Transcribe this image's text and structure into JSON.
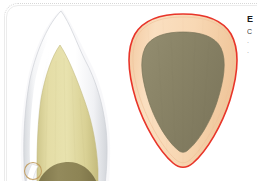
{
  "figure": {
    "background_color": "#ffffff",
    "frame_color": "#ececec",
    "panels": [
      {
        "id": "sagittal",
        "name": "tooth-sagittal-section",
        "description": "Longitudinal (labio-lingual) section of an anterior tooth crown",
        "layers": [
          {
            "name": "enamel",
            "color": "#ffffff",
            "edge_color": "#c9ccd1"
          },
          {
            "name": "enamel-shadow",
            "color": "#e2e5ea"
          },
          {
            "name": "dentin",
            "color": "#ddd69a",
            "edge_color": "#bfb77e"
          },
          {
            "name": "dentin-cut-surface",
            "color": "#8e8557"
          },
          {
            "name": "cervical-marker",
            "color": "#c09a5c"
          }
        ]
      },
      {
        "id": "axial",
        "name": "tooth-axial-section",
        "description": "Transverse (cross) section of the same tooth at the cervical level",
        "layers": [
          {
            "name": "outline",
            "color": "#e8352a"
          },
          {
            "name": "enamel-ring",
            "color": "#f7d6b0",
            "edge_color": "#edbc8c"
          },
          {
            "name": "dentin-core",
            "color": "#8a8467",
            "edge_color": "#7b755c"
          }
        ]
      }
    ]
  },
  "caption": {
    "title": "E",
    "lines": [
      "C",
      "·",
      "·"
    ]
  },
  "colors": {
    "enamel": "#ffffff",
    "enamel_shade": "#e2e5ea",
    "dentin": "#ddd69a",
    "dentin_dark": "#8e8557",
    "peach_ring": "#f7d6b0",
    "red_outline": "#e8352a",
    "olive_core": "#8a8467",
    "marker": "#c09a5c"
  }
}
